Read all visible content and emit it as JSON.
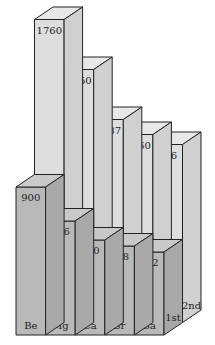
{
  "chart_data": {
    "type": "bar",
    "subtype": "3d-stacked-depth",
    "title": "",
    "categories": [
      "Be",
      "Mg",
      "Ca",
      "Sr",
      "Ba"
    ],
    "series": [
      {
        "name": "1st",
        "values": [
          900,
          736,
          590,
          548,
          502
        ]
      },
      {
        "name": "2nd",
        "values": [
          1760,
          1450,
          1137,
          1060,
          966
        ]
      }
    ],
    "xlabel": "",
    "ylabel": "",
    "grid": false,
    "legend": "depth-labels on right side faces",
    "colors": {
      "front_face": "#b9b9b9",
      "front_top": "#c9c9c9",
      "front_side": "#a9a9a9",
      "back_face": "#dedede",
      "back_top": "#e8e8e8",
      "back_side": "#d0d0d0",
      "edge": "#222222"
    }
  }
}
